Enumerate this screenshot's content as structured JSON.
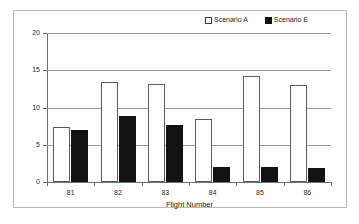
{
  "chart_data": {
    "type": "bar",
    "title": "",
    "subtitle": "",
    "xlabel": "Flight Number",
    "ylabel": "",
    "categories": [
      "81",
      "82",
      "83",
      "84",
      "85",
      "86"
    ],
    "series": [
      {
        "name": "Scenario A",
        "color": "#ffffff",
        "edge_color": "#5c5c5c",
        "values": [
          7.4,
          13.4,
          13.2,
          8.5,
          14.2,
          13.0
        ]
      },
      {
        "name": "Scenario E",
        "color": "#121212",
        "edge_color": "#121212",
        "values": [
          7.0,
          8.9,
          7.6,
          2.0,
          2.0,
          1.9
        ]
      }
    ],
    "ylim": [
      0,
      20
    ],
    "ytick_labels": [
      "0",
      "5",
      "10",
      "15",
      "20"
    ],
    "ytick_values": [
      0,
      5,
      10,
      15,
      20
    ],
    "grid": true,
    "grid_axis": "y",
    "legend_position": "top-right"
  },
  "legend": {
    "entries": [
      {
        "label": "Scenario A",
        "swatch": "open-square-icon"
      },
      {
        "label": "Scenario E",
        "swatch": "filled-square-icon"
      }
    ]
  },
  "axis": {
    "x_title": "Flight Number"
  }
}
